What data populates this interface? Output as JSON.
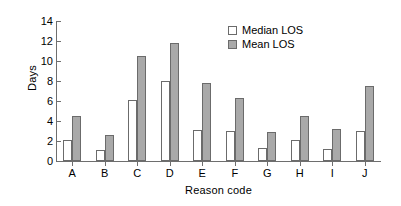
{
  "chart_data": {
    "type": "bar",
    "title": "",
    "xlabel": "Reason code",
    "ylabel": "Days",
    "categories": [
      "A",
      "B",
      "C",
      "D",
      "E",
      "F",
      "G",
      "H",
      "I",
      "J"
    ],
    "series": [
      {
        "name": "Median LOS",
        "color": "#ffffff",
        "values": [
          2.1,
          1.1,
          6.1,
          8.0,
          3.1,
          3.05,
          1.3,
          2.1,
          1.2,
          3.05
        ]
      },
      {
        "name": "Mean LOS",
        "color": "#a9a9a9",
        "values": [
          4.5,
          2.6,
          10.5,
          11.8,
          7.8,
          6.3,
          2.9,
          4.5,
          3.2,
          7.5
        ]
      }
    ],
    "ylim": [
      0,
      14
    ],
    "y_ticks": [
      0,
      2,
      4,
      6,
      8,
      10,
      12,
      14
    ],
    "y_tick_labels": [
      "0",
      "2",
      "4",
      "6",
      "8",
      "10",
      "12",
      "14"
    ],
    "grid": false,
    "legend_position": "top-right",
    "legend_entries": [
      "Median LOS",
      "Mean LOS"
    ]
  }
}
